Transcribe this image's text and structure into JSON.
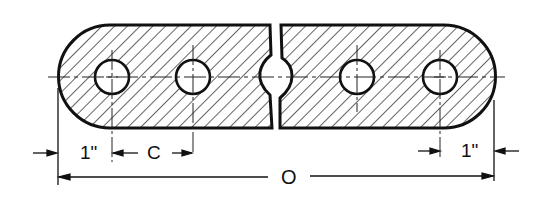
{
  "figure": {
    "ink_color": "#111111",
    "background_color": "#ffffff",
    "hatch": "diagonal 45°",
    "holes_count": 4
  },
  "dimensions": {
    "left_end_offset": "1\"",
    "hole_spacing": "C",
    "overall_length": "O",
    "right_end_offset": "1\""
  }
}
